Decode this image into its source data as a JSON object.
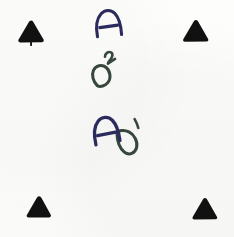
{
  "sheet": {
    "title": "Handwritten annotation scan",
    "width": 234,
    "height": 237,
    "background_color": "#fdfdfc",
    "description": "Scanned white sheet with four black fiducial corner triangles and three handwritten ink marks"
  },
  "colors": {
    "paper": "#fdfdfc",
    "fiducial_black": "#111111",
    "ink_navy": "#2b2b5e",
    "ink_green": "#36473c"
  },
  "fiducials": [
    {
      "name": "top-left",
      "label": "▲",
      "x": 16,
      "y": 19,
      "has_tail": true
    },
    {
      "name": "top-right",
      "label": "▲",
      "x": 181,
      "y": 18,
      "has_tail": false
    },
    {
      "name": "bottom-left",
      "label": "▲",
      "x": 24,
      "y": 194,
      "has_tail": false
    },
    {
      "name": "bottom-right",
      "label": "▲",
      "x": 190,
      "y": 196,
      "has_tail": false
    }
  ],
  "marks": [
    {
      "id": "mark-a-top",
      "text": "A",
      "base": "A",
      "superscript": "",
      "color": "#2b2b5e",
      "x": 92,
      "y": 6,
      "rotation": -6
    },
    {
      "id": "mark-d-squared",
      "text": "D2",
      "base": "D",
      "superscript": "2",
      "color": "#36473c",
      "x": 86,
      "y": 50,
      "rotation": -18
    },
    {
      "id": "mark-a-second",
      "text": "A",
      "base": "A",
      "superscript": "",
      "color": "#2b2b5e",
      "x": 90,
      "y": 112,
      "rotation": -10
    },
    {
      "id": "mark-d-prime",
      "text": "D'",
      "base": "D",
      "superscript": "'",
      "color": "#36473c",
      "x": 112,
      "y": 117,
      "rotation": -14
    }
  ]
}
